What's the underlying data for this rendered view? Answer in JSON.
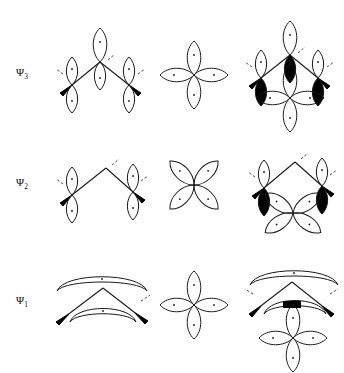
{
  "figure": {
    "background_color": "#ffffff",
    "line_color": "#1a1a1a",
    "fill_color": "#000000",
    "columns": [
      {
        "name": "sigma-framework",
        "label": ""
      },
      {
        "name": "p-orbital-set",
        "label": ""
      },
      {
        "name": "combined-overlap",
        "label": ""
      }
    ],
    "rows": [
      {
        "id": "psi3",
        "label": "Ψ",
        "subscript": "3",
        "description": "antibonding combination",
        "left_cell": "three-lobe-chain-with-apex",
        "middle_cell": "four-lobe-cross",
        "right_cell": "overlay-with-filled-lobes"
      },
      {
        "id": "psi2",
        "label": "Ψ",
        "subscript": "2",
        "description": "nonbonding combination",
        "left_cell": "two-lobe-chain-bare-apex",
        "middle_cell": "four-lobe-diagonal-cross",
        "right_cell": "overlay-with-filled-lobes"
      },
      {
        "id": "psi1",
        "label": "Ψ",
        "subscript": "1",
        "description": "bonding combination",
        "left_cell": "delocalized-curved-arcs",
        "middle_cell": "four-lobe-cross",
        "right_cell": "overlay-arcs-with-filled-cap"
      }
    ]
  }
}
